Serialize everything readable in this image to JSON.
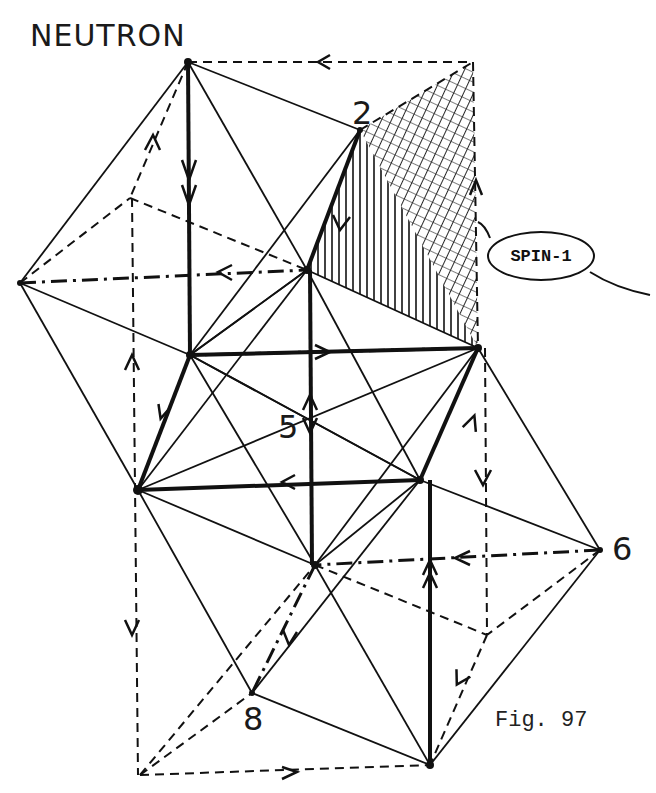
{
  "figure": {
    "title": "NEUTRON",
    "caption": "Fig. 97",
    "callout": "SPIN-1",
    "vertex_labels": {
      "v2": "2",
      "v5": "5",
      "v6": "6",
      "v8": "8"
    }
  },
  "colors": {
    "ink": "#111111",
    "background": "#ffffff"
  }
}
